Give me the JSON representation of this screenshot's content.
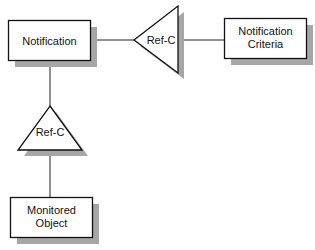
{
  "diagram": {
    "nodes": [
      {
        "id": "notification",
        "type": "entity",
        "label_lines": [
          "Notification"
        ]
      },
      {
        "id": "notification-criteria",
        "type": "entity",
        "label_lines": [
          "Notification",
          "Criteria"
        ]
      },
      {
        "id": "monitored-object",
        "type": "entity",
        "label_lines": [
          "Monitored",
          "Object"
        ]
      },
      {
        "id": "ref-c-horizontal",
        "type": "relationship-triangle",
        "label": "Ref-C",
        "orientation": "left"
      },
      {
        "id": "ref-c-vertical",
        "type": "relationship-triangle",
        "label": "Ref-C",
        "orientation": "up"
      }
    ],
    "edges": [
      {
        "from": "notification",
        "to": "ref-c-horizontal"
      },
      {
        "from": "ref-c-horizontal",
        "to": "notification-criteria"
      },
      {
        "from": "notification",
        "to": "ref-c-vertical"
      },
      {
        "from": "ref-c-vertical",
        "to": "monitored-object"
      }
    ],
    "colors": {
      "stroke": "#111111",
      "shadow": "#a6a6a6",
      "fill": "#ffffff"
    }
  }
}
